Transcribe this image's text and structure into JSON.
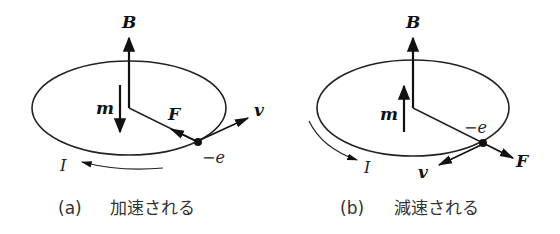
{
  "figure": {
    "panels": [
      {
        "id": "a",
        "caption_label": "(a)",
        "caption_text": "加速される",
        "labels": {
          "B": "B",
          "m": "m",
          "F": "F",
          "v": "v",
          "charge": "−e",
          "I": "I"
        },
        "m_direction": "down",
        "F_direction": "toward-center",
        "v_direction": "outward-up-right",
        "I_direction": "counterclockwise-arrow-left"
      },
      {
        "id": "b",
        "caption_label": "(b)",
        "caption_text": "減速される",
        "labels": {
          "B": "B",
          "m": "m",
          "F": "F",
          "v": "v",
          "charge": "−e",
          "I": "I"
        },
        "m_direction": "up",
        "F_direction": "away-from-center",
        "v_direction": "down-left",
        "I_direction": "arrow-right"
      }
    ]
  }
}
